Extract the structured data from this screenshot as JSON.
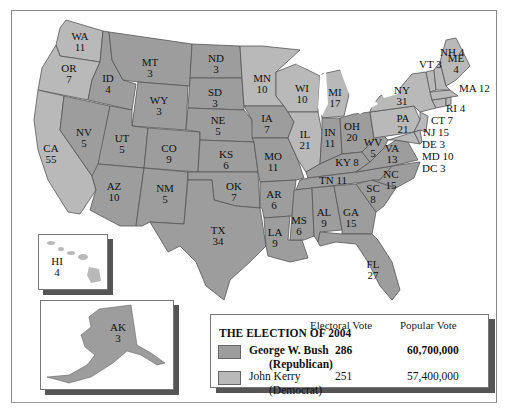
{
  "colors": {
    "republican": "#9d9d9d",
    "democrat": "#b9b9b9",
    "water": "#ffffff",
    "border": "#555555"
  },
  "legend": {
    "title": "THE ELECTION OF 2004",
    "col_electoral": "Electoral Vote",
    "col_popular": "Popular Vote",
    "candidates": [
      {
        "name": "George W. Bush",
        "party": "(Republican)",
        "electoral": "286",
        "popular": "60,700,000",
        "bold": true
      },
      {
        "name": "John Kerry",
        "party": "(Democrat)",
        "electoral": "251",
        "popular": "57,400,000",
        "bold": false
      }
    ]
  },
  "states": {
    "WA": {
      "abbr": "WA",
      "ev": "11",
      "winner": "D"
    },
    "OR": {
      "abbr": "OR",
      "ev": "7",
      "winner": "D"
    },
    "CA": {
      "abbr": "CA",
      "ev": "55",
      "winner": "D"
    },
    "ID": {
      "abbr": "ID",
      "ev": "4",
      "winner": "R"
    },
    "NV": {
      "abbr": "NV",
      "ev": "5",
      "winner": "R"
    },
    "MT": {
      "abbr": "MT",
      "ev": "3",
      "winner": "R"
    },
    "WY": {
      "abbr": "WY",
      "ev": "3",
      "winner": "R"
    },
    "UT": {
      "abbr": "UT",
      "ev": "5",
      "winner": "R"
    },
    "AZ": {
      "abbr": "AZ",
      "ev": "10",
      "winner": "R"
    },
    "CO": {
      "abbr": "CO",
      "ev": "9",
      "winner": "R"
    },
    "NM": {
      "abbr": "NM",
      "ev": "5",
      "winner": "R"
    },
    "ND": {
      "abbr": "ND",
      "ev": "3",
      "winner": "R"
    },
    "SD": {
      "abbr": "SD",
      "ev": "3",
      "winner": "R"
    },
    "NE": {
      "abbr": "NE",
      "ev": "5",
      "winner": "R"
    },
    "KS": {
      "abbr": "KS",
      "ev": "6",
      "winner": "R"
    },
    "OK": {
      "abbr": "OK",
      "ev": "7",
      "winner": "R"
    },
    "TX": {
      "abbr": "TX",
      "ev": "34",
      "winner": "R"
    },
    "MN": {
      "abbr": "MN",
      "ev": "10",
      "winner": "D"
    },
    "IA": {
      "abbr": "IA",
      "ev": "7",
      "winner": "R"
    },
    "MO": {
      "abbr": "MO",
      "ev": "11",
      "winner": "R"
    },
    "AR": {
      "abbr": "AR",
      "ev": "6",
      "winner": "R"
    },
    "LA": {
      "abbr": "LA",
      "ev": "9",
      "winner": "R"
    },
    "WI": {
      "abbr": "WI",
      "ev": "10",
      "winner": "D"
    },
    "IL": {
      "abbr": "IL",
      "ev": "21",
      "winner": "D"
    },
    "MI": {
      "abbr": "MI",
      "ev": "17",
      "winner": "D"
    },
    "IN": {
      "abbr": "IN",
      "ev": "11",
      "winner": "R"
    },
    "OH": {
      "abbr": "OH",
      "ev": "20",
      "winner": "R"
    },
    "KY": {
      "abbr": "KY",
      "ev": "8",
      "winner": "R"
    },
    "TN": {
      "abbr": "TN",
      "ev": "11",
      "winner": "R"
    },
    "MS": {
      "abbr": "MS",
      "ev": "6",
      "winner": "R"
    },
    "AL": {
      "abbr": "AL",
      "ev": "9",
      "winner": "R"
    },
    "GA": {
      "abbr": "GA",
      "ev": "15",
      "winner": "R"
    },
    "FL": {
      "abbr": "FL",
      "ev": "27",
      "winner": "R"
    },
    "SC": {
      "abbr": "SC",
      "ev": "8",
      "winner": "R"
    },
    "NC": {
      "abbr": "NC",
      "ev": "15",
      "winner": "R"
    },
    "VA": {
      "abbr": "VA",
      "ev": "13",
      "winner": "R"
    },
    "WV": {
      "abbr": "WV",
      "ev": "5",
      "winner": "R"
    },
    "PA": {
      "abbr": "PA",
      "ev": "21",
      "winner": "D"
    },
    "NY": {
      "abbr": "NY",
      "ev": "31",
      "winner": "D"
    },
    "ME": {
      "abbr": "ME",
      "ev": "4",
      "winner": "D"
    },
    "NH": {
      "abbr": "NH",
      "ev": "4",
      "winner": "D"
    },
    "VT": {
      "abbr": "VT",
      "ev": "3",
      "winner": "D"
    },
    "MA": {
      "abbr": "MA",
      "ev": "12",
      "winner": "D"
    },
    "RI": {
      "abbr": "RI",
      "ev": "4",
      "winner": "D"
    },
    "CT": {
      "abbr": "CT",
      "ev": "7",
      "winner": "D"
    },
    "NJ": {
      "abbr": "NJ",
      "ev": "15",
      "winner": "D"
    },
    "DE": {
      "abbr": "DE",
      "ev": "3",
      "winner": "D"
    },
    "MD": {
      "abbr": "MD",
      "ev": "10",
      "winner": "D"
    },
    "DC": {
      "abbr": "DC",
      "ev": "3",
      "winner": "D"
    },
    "HI": {
      "abbr": "HI",
      "ev": "4",
      "winner": "D"
    },
    "AK": {
      "abbr": "AK",
      "ev": "3",
      "winner": "R"
    }
  },
  "ne_labels": {
    "NH": "NH 4",
    "VT": "VT 3",
    "MA": "MA 12",
    "RI": "RI 4",
    "CT": "CT 7",
    "NJ": "NJ 15",
    "DE": "DE 3",
    "MD": "MD 10",
    "DC": "DC 3",
    "KY": "KY 8",
    "TN": "TN 11"
  }
}
